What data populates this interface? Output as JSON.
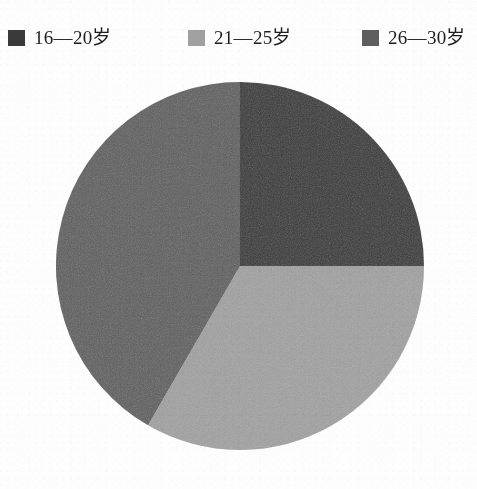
{
  "legend": {
    "items": [
      {
        "label": "16—20岁",
        "color": "#3a3a3a",
        "swatch_icon": "legend-swatch-icon",
        "x": 8
      },
      {
        "label": "21—25岁",
        "color": "#a0a0a0",
        "swatch_icon": "legend-swatch-icon",
        "x": 188
      },
      {
        "label": "26—30岁",
        "color": "#5e5e5e",
        "swatch_icon": "legend-swatch-icon",
        "x": 362
      }
    ]
  },
  "chart_data": {
    "type": "pie",
    "title": "",
    "subtitle": "",
    "xlabel": "",
    "ylabel": "",
    "legend_position": "top",
    "grid": false,
    "start_angle_deg": 0,
    "direction": "clockwise",
    "center": {
      "x": 240,
      "y": 266
    },
    "radius": 184,
    "categories": [
      "16—20岁",
      "21—25岁",
      "26—30岁"
    ],
    "values": [
      25.0,
      33.3,
      41.7
    ],
    "colors": [
      "#3a3a3a",
      "#a0a0a0",
      "#5e5e5e"
    ],
    "slices": [
      {
        "label": "16—20岁",
        "value": 25.0,
        "color": "#3a3a3a",
        "start_deg": 0,
        "end_deg": 90
      },
      {
        "label": "21—25岁",
        "value": 33.3,
        "color": "#a0a0a0",
        "start_deg": 90,
        "end_deg": 210
      },
      {
        "label": "26—30岁",
        "value": 41.7,
        "color": "#5e5e5e",
        "start_deg": 210,
        "end_deg": 360
      }
    ]
  }
}
